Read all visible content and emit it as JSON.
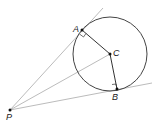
{
  "diagram": {
    "type": "geometry-tangent-circle",
    "colors": {
      "circle": "#444444",
      "radius": "#333333",
      "tangent": "#aaaaaa",
      "point": "#111111"
    },
    "circle": {
      "cx": 110,
      "cy": 54,
      "r": 37
    },
    "points": {
      "A": {
        "x": 82,
        "y": 30,
        "label": "A"
      },
      "B": {
        "x": 117,
        "y": 89,
        "label": "B"
      },
      "C": {
        "x": 110,
        "y": 54,
        "label": "C"
      },
      "P": {
        "x": 10,
        "y": 110,
        "label": "P"
      }
    },
    "labels": {
      "A": "A",
      "B": "B",
      "C": "C",
      "P": "P"
    }
  }
}
